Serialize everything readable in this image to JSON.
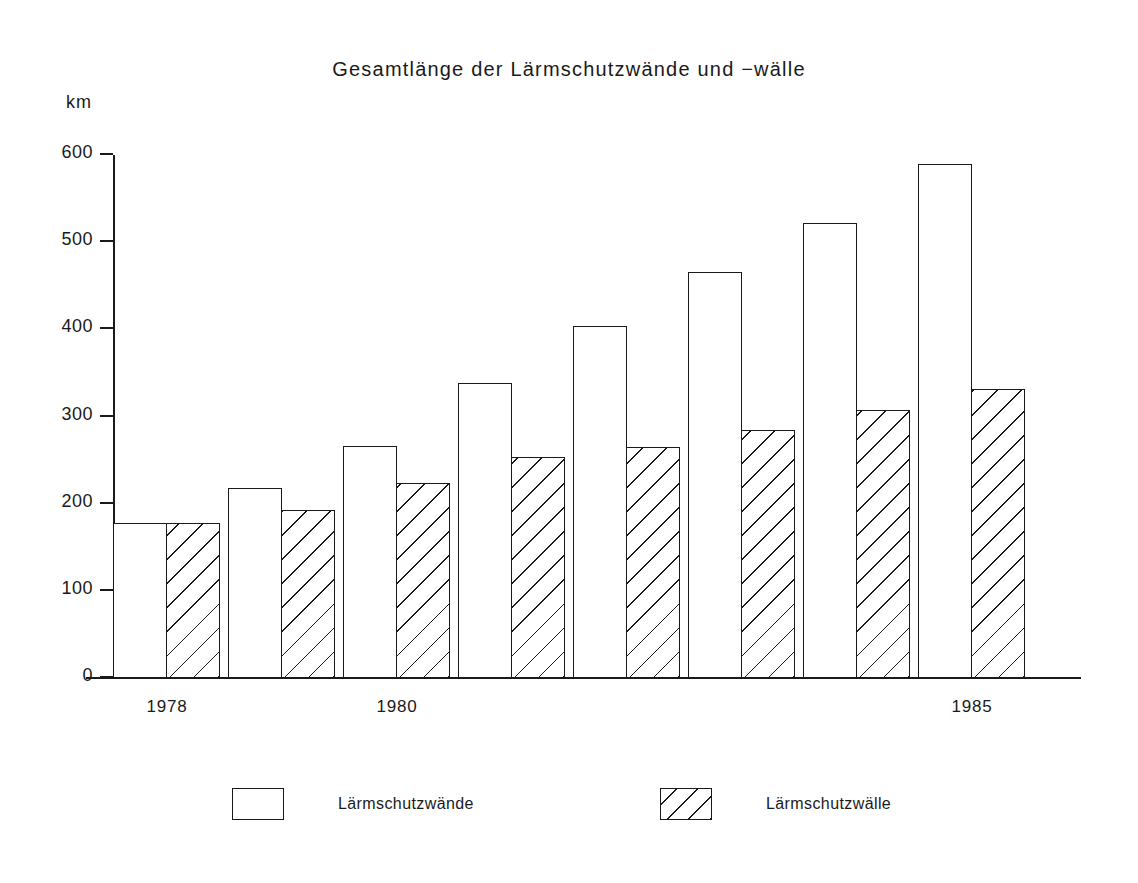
{
  "chart_data": {
    "type": "bar",
    "title": "Gesamtlänge der Lärmschutzwände und −wälle",
    "subtitle": "",
    "xlabel": "",
    "ylabel": "km",
    "ylim": [
      0,
      600
    ],
    "yticks": [
      0,
      100,
      200,
      300,
      400,
      500,
      600
    ],
    "ytick_labels": [
      "0",
      "100",
      "200",
      "300",
      "400",
      "500",
      "600"
    ],
    "grid": false,
    "legend_position": "bottom",
    "categories": [
      "1978",
      "1979",
      "1980",
      "1981",
      "1982",
      "1983",
      "1984",
      "1985"
    ],
    "visible_tick_labels": [
      "1978",
      "1980",
      "1985"
    ],
    "series": [
      {
        "name": "Lärmschutzwände",
        "style": "outline",
        "values": [
          178,
          218,
          266,
          339,
          404,
          466,
          522,
          590
        ]
      },
      {
        "name": "Lärmschutzwälle",
        "style": "hatched",
        "values": [
          178,
          193,
          224,
          254,
          265,
          284,
          308,
          331
        ]
      }
    ]
  },
  "legend": {
    "items": [
      {
        "label": "Lärmschutzwände"
      },
      {
        "label": "Lärmschutzwälle"
      }
    ]
  },
  "colors": {
    "ink": "#1a1a1a",
    "background": "#ffffff"
  }
}
